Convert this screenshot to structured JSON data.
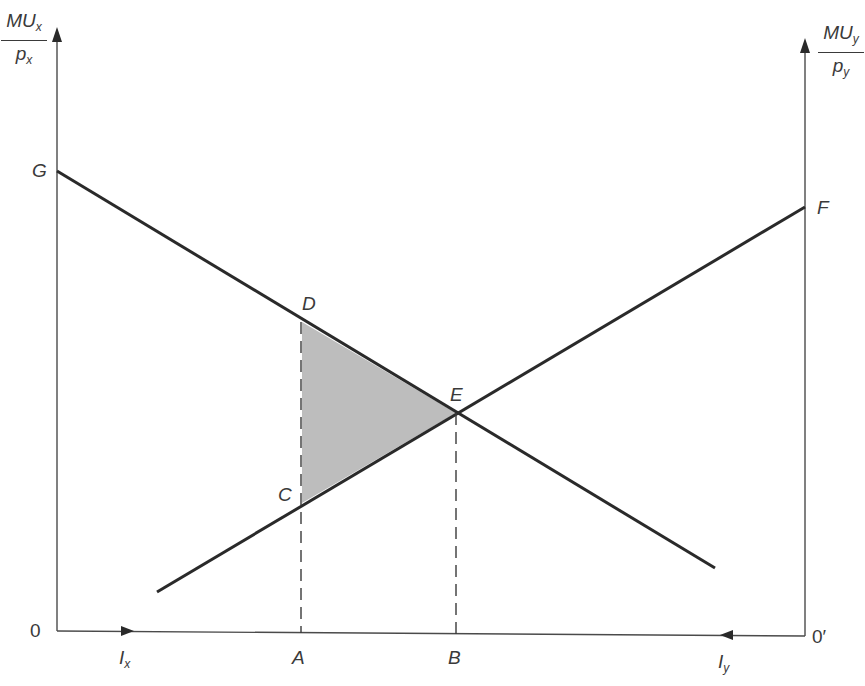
{
  "diagram": {
    "type": "edgeworth-box-style marginal utility diagram",
    "left_axis": {
      "label_numerator": "MU",
      "label_numerator_sub": "x",
      "label_denominator": "p",
      "label_denominator_sub": "x",
      "origin_label": "0"
    },
    "right_axis": {
      "label_numerator": "MU",
      "label_numerator_sub": "y",
      "label_denominator": "p",
      "label_denominator_sub": "y",
      "origin_label": "0′"
    },
    "bottom_axis": {
      "left_label": "I",
      "left_label_sub": "x",
      "right_label": "I",
      "right_label_sub": "y"
    },
    "points": {
      "G": "G",
      "F": "F",
      "D": "D",
      "C": "C",
      "E": "E",
      "A": "A",
      "B": "B"
    },
    "lines": [
      {
        "name": "GE-line",
        "from": "G",
        "to": "lower-right",
        "slope": "negative"
      },
      {
        "name": "FE-line",
        "from": "lower-left",
        "to": "F",
        "slope": "positive"
      }
    ],
    "shaded_region": {
      "vertices": [
        "D",
        "E",
        "C"
      ],
      "color": "#bdbdbd"
    },
    "colors": {
      "line": "#2a2a2a",
      "axis": "#4a4a4a",
      "shade": "#bdbdbd",
      "background": "#ffffff"
    }
  }
}
